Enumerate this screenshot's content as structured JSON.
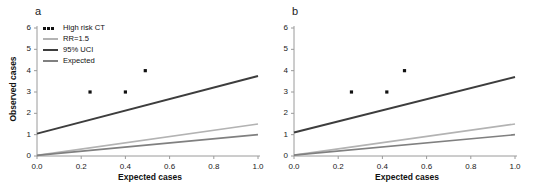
{
  "figure": {
    "background_color": "#ffffff",
    "panels": [
      {
        "label": "a",
        "xlabel": "Expected cases",
        "ylabel": "Observed cases",
        "show_ylabel": true,
        "show_legend": true
      },
      {
        "label": "b",
        "xlabel": "Expected cases",
        "ylabel": "",
        "show_ylabel": false,
        "show_legend": false
      }
    ]
  },
  "legend": {
    "position": "top-left",
    "entries": [
      {
        "label": "High risk CT",
        "marker": "dots",
        "color": "#111111"
      },
      {
        "label": "RR=1.5",
        "marker": "line",
        "color": "#b3b3b3"
      },
      {
        "label": "95% UCI",
        "marker": "line",
        "color": "#3d3d3d"
      },
      {
        "label": "Expected",
        "marker": "line",
        "color": "#808080"
      }
    ]
  },
  "colors": {
    "high_risk_ct": "#111111",
    "rr_1_5": "#b3b3b3",
    "uci_95": "#3d3d3d",
    "expected": "#808080",
    "axis": "#9a9a9a",
    "text": "#1a1a1a"
  },
  "chart_data": [
    {
      "type": "scatter",
      "panel": "a",
      "title": "",
      "xlabel": "Expected cases",
      "ylabel": "Observed cases",
      "xlim": [
        0.0,
        1.0
      ],
      "ylim": [
        0,
        6
      ],
      "xticks": [
        0.0,
        0.2,
        0.4,
        0.6,
        0.8,
        1.0
      ],
      "xtick_labels": [
        "0.0",
        "0.2",
        "0.4",
        "0.6",
        "0.8",
        "1.0"
      ],
      "yticks": [
        0,
        1,
        2,
        3,
        4,
        5,
        6
      ],
      "ytick_labels": [
        "0",
        "1",
        "2",
        "3",
        "4",
        "5",
        "6"
      ],
      "grid": false,
      "legend_position": "upper left",
      "series": [
        {
          "name": "High risk CT",
          "kind": "scatter",
          "color": "#111111",
          "points": [
            {
              "x": 0.24,
              "y": 3
            },
            {
              "x": 0.4,
              "y": 3
            },
            {
              "x": 0.49,
              "y": 4
            }
          ]
        },
        {
          "name": "95% UCI",
          "kind": "line",
          "color": "#3d3d3d",
          "linewidth": 2.0,
          "x": [
            0.0,
            1.0
          ],
          "values": [
            1.05,
            3.75
          ]
        },
        {
          "name": "RR=1.5",
          "kind": "line",
          "color": "#b3b3b3",
          "linewidth": 1.6,
          "x": [
            0.0,
            1.0
          ],
          "values": [
            0.03,
            1.5
          ]
        },
        {
          "name": "Expected",
          "kind": "line",
          "color": "#808080",
          "linewidth": 1.6,
          "x": [
            0.0,
            1.0
          ],
          "values": [
            0.03,
            1.0
          ]
        }
      ]
    },
    {
      "type": "scatter",
      "panel": "b",
      "title": "",
      "xlabel": "Expected cases",
      "ylabel": "",
      "xlim": [
        0.0,
        1.0
      ],
      "ylim": [
        0,
        6
      ],
      "xticks": [
        0.0,
        0.2,
        0.4,
        0.6,
        0.8,
        1.0
      ],
      "xtick_labels": [
        "0.0",
        "0.2",
        "0.4",
        "0.6",
        "0.8",
        "1.0"
      ],
      "yticks": [
        0,
        1,
        2,
        3,
        4,
        5,
        6
      ],
      "ytick_labels": [
        "0",
        "1",
        "2",
        "3",
        "4",
        "5",
        "6"
      ],
      "grid": false,
      "legend_position": "none",
      "series": [
        {
          "name": "High risk CT",
          "kind": "scatter",
          "color": "#111111",
          "points": [
            {
              "x": 0.26,
              "y": 3
            },
            {
              "x": 0.42,
              "y": 3
            },
            {
              "x": 0.5,
              "y": 4
            }
          ]
        },
        {
          "name": "95% UCI",
          "kind": "line",
          "color": "#3d3d3d",
          "linewidth": 2.0,
          "x": [
            0.0,
            1.0
          ],
          "values": [
            1.1,
            3.7
          ]
        },
        {
          "name": "RR=1.5",
          "kind": "line",
          "color": "#b3b3b3",
          "linewidth": 1.6,
          "x": [
            0.0,
            1.0
          ],
          "values": [
            0.04,
            1.5
          ]
        },
        {
          "name": "Expected",
          "kind": "line",
          "color": "#808080",
          "linewidth": 1.6,
          "x": [
            0.0,
            1.0
          ],
          "values": [
            0.04,
            1.0
          ]
        }
      ]
    }
  ]
}
